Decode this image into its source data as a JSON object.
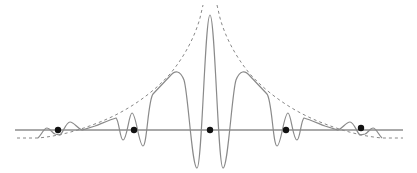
{
  "diagram": {
    "type": "waveform-with-envelope",
    "colors": {
      "axis": "#555555",
      "waveform": "#8a8a8a",
      "envelope": "#888888",
      "dots": "#111111",
      "background": "#ffffff"
    },
    "axis": {
      "y": 130,
      "x_start": 15,
      "x_end": 403
    },
    "dots": [
      {
        "x": 58,
        "y": 130
      },
      {
        "x": 134,
        "y": 130
      },
      {
        "x": 210,
        "y": 130
      },
      {
        "x": 286,
        "y": 130
      },
      {
        "x": 361,
        "y": 128
      }
    ],
    "envelope_style": "dashed",
    "waveform_style": "solid"
  }
}
